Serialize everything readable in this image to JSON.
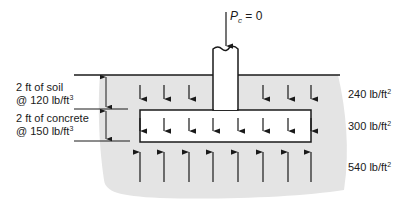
{
  "load": {
    "symbol": "P",
    "subscript": "c",
    "equals": "= 0"
  },
  "layers": [
    {
      "thickness": "2 ft of soil",
      "unit_weight_prefix": "@ 120 lb/ft",
      "unit_weight_exp": "3"
    },
    {
      "thickness": "2 ft of concrete",
      "unit_weight_prefix": "@ 150 lb/ft",
      "unit_weight_exp": "3"
    }
  ],
  "pressures": [
    {
      "value": "240 lb/ft",
      "exp": "2",
      "description": "soil pressure on footing top"
    },
    {
      "value": "300 lb/ft",
      "exp": "2",
      "description": "combined soil + concrete"
    },
    {
      "value": "540 lb/ft",
      "exp": "2",
      "description": "upward soil reaction"
    }
  ],
  "colors": {
    "soil": "#e4e4e4",
    "line": "#1a1a1a",
    "footing": "#ffffff"
  }
}
